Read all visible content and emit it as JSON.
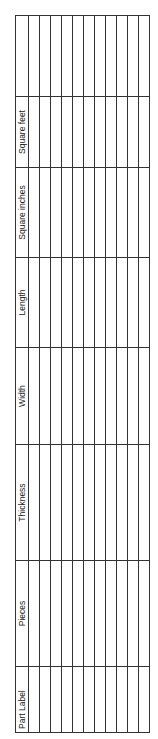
{
  "table": {
    "headers": [
      "Part Label",
      "Pieces",
      "Thickness",
      "Width",
      "Length",
      "Square inches",
      "Square feet"
    ],
    "row_count": 11
  }
}
